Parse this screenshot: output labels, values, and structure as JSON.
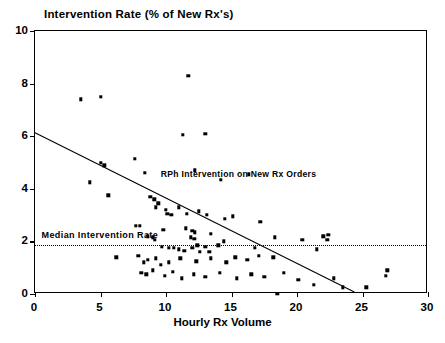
{
  "chart_data": {
    "type": "scatter",
    "title": "Intervention Rate (% of New Rx's)",
    "xlabel": "Hourly Rx Volume",
    "ylabel": "Intervention Rate (% of New Rx's)",
    "xlim": [
      0,
      30
    ],
    "ylim": [
      0,
      10
    ],
    "xticks": [
      0,
      5,
      10,
      15,
      20,
      25,
      30
    ],
    "yticks": [
      0,
      2,
      4,
      6,
      8,
      10
    ],
    "grid": false,
    "legend": "none",
    "annotations": [
      {
        "name": "series-note",
        "text": "RPh Intervention on New Rx Orders",
        "x": 9.6,
        "y": 4.55
      },
      {
        "name": "median-note",
        "text": "Median Intervention Rate",
        "x": 0.5,
        "y": 2.25
      }
    ],
    "median_line": {
      "label": "Median Intervention Rate",
      "value": 1.85,
      "style": "dotted"
    },
    "trend_line": {
      "style": "solid",
      "x0": 0.0,
      "y0": 6.1,
      "x1": 24.5,
      "y1": 0.0
    },
    "points": [
      [
        3.5,
        7.4
      ],
      [
        5.0,
        7.5
      ],
      [
        11.7,
        8.3
      ],
      [
        4.2,
        4.25
      ],
      [
        5.0,
        5.0
      ],
      [
        5.3,
        4.9
      ],
      [
        5.6,
        3.75
      ],
      [
        7.6,
        5.15
      ],
      [
        8.4,
        4.6
      ],
      [
        11.3,
        6.05
      ],
      [
        13.0,
        6.1
      ],
      [
        12.2,
        4.7
      ],
      [
        14.2,
        4.35
      ],
      [
        16.3,
        4.55
      ],
      [
        8.8,
        3.7
      ],
      [
        9.1,
        3.6
      ],
      [
        9.4,
        3.45
      ],
      [
        9.2,
        3.3
      ],
      [
        10.0,
        3.2
      ],
      [
        10.1,
        3.05
      ],
      [
        10.4,
        3.0
      ],
      [
        11.0,
        3.3
      ],
      [
        11.6,
        3.05
      ],
      [
        12.5,
        3.15
      ],
      [
        13.1,
        3.0
      ],
      [
        14.5,
        2.85
      ],
      [
        15.1,
        2.95
      ],
      [
        17.2,
        2.75
      ],
      [
        7.7,
        2.6
      ],
      [
        8.0,
        2.6
      ],
      [
        9.8,
        2.45
      ],
      [
        11.5,
        2.5
      ],
      [
        12.0,
        2.4
      ],
      [
        13.4,
        2.3
      ],
      [
        8.6,
        2.2
      ],
      [
        9.0,
        2.15
      ],
      [
        9.15,
        2.05
      ],
      [
        11.9,
        2.15
      ],
      [
        12.15,
        2.1
      ],
      [
        12.2,
        2.35
      ],
      [
        14.4,
        2.0
      ],
      [
        18.3,
        2.15
      ],
      [
        20.4,
        2.05
      ],
      [
        22.0,
        2.2
      ],
      [
        22.4,
        2.25
      ],
      [
        22.3,
        2.05
      ],
      [
        9.7,
        1.8
      ],
      [
        10.2,
        1.75
      ],
      [
        10.6,
        1.75
      ],
      [
        11.0,
        1.7
      ],
      [
        11.4,
        1.65
      ],
      [
        12.0,
        1.75
      ],
      [
        12.4,
        1.85
      ],
      [
        12.6,
        1.6
      ],
      [
        13.0,
        1.8
      ],
      [
        13.3,
        1.6
      ],
      [
        14.0,
        1.85
      ],
      [
        16.8,
        1.75
      ],
      [
        21.5,
        1.7
      ],
      [
        6.2,
        1.4
      ],
      [
        7.9,
        1.45
      ],
      [
        8.3,
        1.2
      ],
      [
        8.6,
        1.3
      ],
      [
        9.2,
        1.35
      ],
      [
        9.6,
        1.1
      ],
      [
        10.2,
        1.2
      ],
      [
        11.1,
        1.35
      ],
      [
        12.3,
        1.25
      ],
      [
        13.4,
        1.35
      ],
      [
        14.6,
        1.2
      ],
      [
        15.3,
        1.4
      ],
      [
        16.2,
        1.3
      ],
      [
        17.1,
        1.45
      ],
      [
        18.2,
        1.4
      ],
      [
        8.1,
        0.8
      ],
      [
        8.5,
        0.75
      ],
      [
        9.0,
        0.9
      ],
      [
        9.9,
        0.7
      ],
      [
        10.5,
        0.85
      ],
      [
        11.2,
        0.6
      ],
      [
        12.1,
        0.75
      ],
      [
        13.0,
        0.65
      ],
      [
        14.1,
        0.8
      ],
      [
        15.4,
        0.6
      ],
      [
        16.5,
        0.75
      ],
      [
        17.5,
        0.65
      ],
      [
        19.0,
        0.8
      ],
      [
        20.1,
        0.55
      ],
      [
        22.8,
        0.6
      ],
      [
        21.3,
        0.35
      ],
      [
        23.5,
        0.25
      ],
      [
        25.3,
        0.25
      ],
      [
        18.5,
        0.0
      ],
      [
        26.9,
        0.9
      ],
      [
        26.8,
        0.7
      ]
    ]
  }
}
